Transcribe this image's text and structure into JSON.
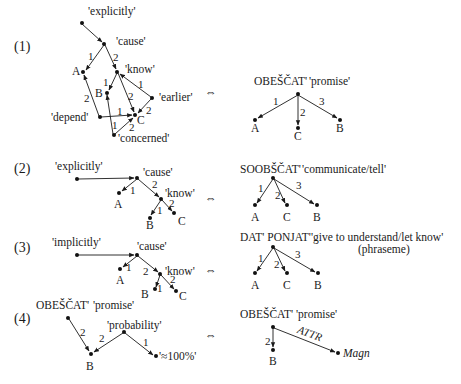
{
  "equivalence_symbol": "⇔",
  "diagrams": [
    {
      "index": "(1)",
      "left": {
        "nodes": {
          "explicitly": "'explicitly'",
          "cause": "'cause'",
          "A": "A",
          "know": "'know'",
          "B": "B",
          "earlier": "'earlier'",
          "depend": "'depend'",
          "C": "C",
          "concerned": "'concerned'"
        },
        "edges": [
          {
            "from": "explicitly",
            "to": "cause",
            "label": ""
          },
          {
            "from": "cause",
            "to": "A",
            "label": "1"
          },
          {
            "from": "cause",
            "to": "know",
            "label": "2"
          },
          {
            "from": "know",
            "to": "B",
            "label": "1"
          },
          {
            "from": "know",
            "to": "C",
            "label": "2"
          },
          {
            "from": "earlier",
            "to": "know",
            "label": "1"
          },
          {
            "from": "earlier",
            "to": "C",
            "label": "2"
          },
          {
            "from": "depend",
            "to": "A",
            "label": "2"
          },
          {
            "from": "depend",
            "to": "C",
            "label": "1"
          },
          {
            "from": "concerned",
            "to": "B",
            "label": "1"
          },
          {
            "from": "concerned",
            "to": "C",
            "label": "2"
          }
        ]
      },
      "right": {
        "head": "OBEŠČAT'",
        "gloss": "'promise'",
        "children": [
          {
            "label": "1",
            "node": "A"
          },
          {
            "label": "2",
            "node": "C"
          },
          {
            "label": "3",
            "node": "B"
          }
        ]
      }
    },
    {
      "index": "(2)",
      "left": {
        "nodes": {
          "explicitly": "'explicitly'",
          "cause": "'cause'",
          "A": "A",
          "know": "'know'",
          "B": "B",
          "C": "C"
        },
        "edges": [
          {
            "from": "explicitly",
            "to": "cause",
            "label": ""
          },
          {
            "from": "cause",
            "to": "A",
            "label": "1"
          },
          {
            "from": "cause",
            "to": "know",
            "label": "2"
          },
          {
            "from": "know",
            "to": "B",
            "label": "1"
          },
          {
            "from": "know",
            "to": "C",
            "label": "2"
          }
        ]
      },
      "right": {
        "head": "SOOBŠČAT'",
        "gloss": "'communicate/tell'",
        "children": [
          {
            "label": "1",
            "node": "A"
          },
          {
            "label": "2",
            "node": "C"
          },
          {
            "label": "3",
            "node": "B"
          }
        ]
      }
    },
    {
      "index": "(3)",
      "left": {
        "nodes": {
          "implicitly": "'implicitly'",
          "cause": "'cause'",
          "A": "A",
          "know": "'know'",
          "B": "B",
          "C": "C"
        },
        "edges": [
          {
            "from": "implicitly",
            "to": "cause",
            "label": ""
          },
          {
            "from": "cause",
            "to": "A",
            "label": "1"
          },
          {
            "from": "cause",
            "to": "know",
            "label": "2"
          },
          {
            "from": "know",
            "to": "B",
            "label": "1"
          },
          {
            "from": "know",
            "to": "C",
            "label": "2"
          }
        ]
      },
      "right": {
        "head": "DAT' PONJAT'",
        "gloss": "'give to understand/let know'",
        "note": "(phraseme)",
        "children": [
          {
            "label": "1",
            "node": "A"
          },
          {
            "label": "2",
            "node": "C"
          },
          {
            "label": "3",
            "node": "B"
          }
        ]
      }
    },
    {
      "index": "(4)",
      "left": {
        "head": "OBEŠČAT'",
        "gloss": "'promise'",
        "nodes": {
          "B": "B",
          "probability": "'probability'",
          "approx100": "'≈100%'"
        },
        "edges": [
          {
            "from": "promise",
            "to": "B",
            "label": "2"
          },
          {
            "from": "probability",
            "to": "B",
            "label": "2"
          },
          {
            "from": "probability",
            "to": "approx100",
            "label": "1"
          }
        ]
      },
      "right": {
        "head": "OBEŠČAT'",
        "gloss": "'promise'",
        "children": [
          {
            "label": "2",
            "node": "B"
          },
          {
            "label": "ATTR",
            "node": "Magn"
          }
        ]
      }
    }
  ]
}
